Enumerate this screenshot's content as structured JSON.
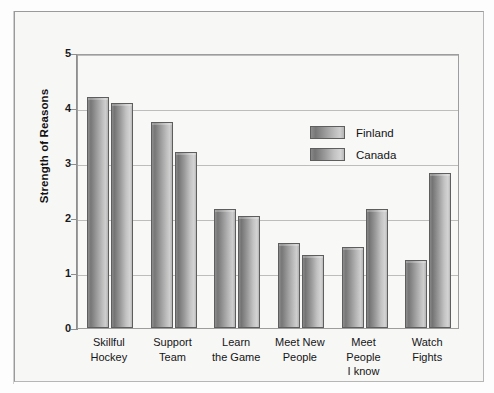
{
  "chart_data": {
    "type": "bar",
    "title": "",
    "subtitle": "",
    "xlabel": "",
    "ylabel": "Strength of Reasons",
    "ylim": [
      0,
      5
    ],
    "yticks": [
      "0",
      "1",
      "2",
      "3",
      "4",
      "5"
    ],
    "grid": true,
    "legend_position": "upper-center",
    "categories": [
      "Skillful\nHockey",
      "Support\nTeam",
      "Learn\nthe Game",
      "Meet New\nPeople",
      "Meet\nPeople\nI know",
      "Watch\nFights"
    ],
    "series": [
      {
        "name": "Finland",
        "color": "#8d8d8d",
        "values": [
          4.2,
          3.75,
          2.17,
          1.55,
          1.47,
          1.23
        ]
      },
      {
        "name": "Canada",
        "color": "#9a9a9a",
        "values": [
          4.1,
          3.2,
          2.03,
          1.33,
          2.17,
          2.82
        ]
      }
    ]
  },
  "colors": {
    "frame_border": "#9a9a9a",
    "plot_border": "#9d9d9d",
    "gridline": "#bdbdbd",
    "background": "#f7f7f6",
    "axis": "#8e8e8e",
    "text": "#151515"
  }
}
